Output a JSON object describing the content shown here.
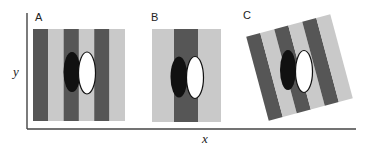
{
  "figure": {
    "axes": {
      "x_label": "x",
      "y_label": "y",
      "color": "#444444"
    },
    "colors": {
      "dark_stripe": "#565656",
      "light_stripe": "#c9c9c9",
      "black_ellipse": "#111111",
      "white_ellipse": "#ffffff",
      "ellipse_outline": "#111111"
    },
    "panels": [
      {
        "label": "A",
        "description": "Six vertical stripes (dark/light alternating) with black and white ellipse pair; ellipses straddle dark-light stripe boundary"
      },
      {
        "label": "B",
        "description": "Light background with single central dark vertical stripe; black and white ellipse pair"
      },
      {
        "label": "C",
        "description": "Stripe grating rotated about 15 degrees with upright black and white ellipse pair"
      }
    ]
  }
}
